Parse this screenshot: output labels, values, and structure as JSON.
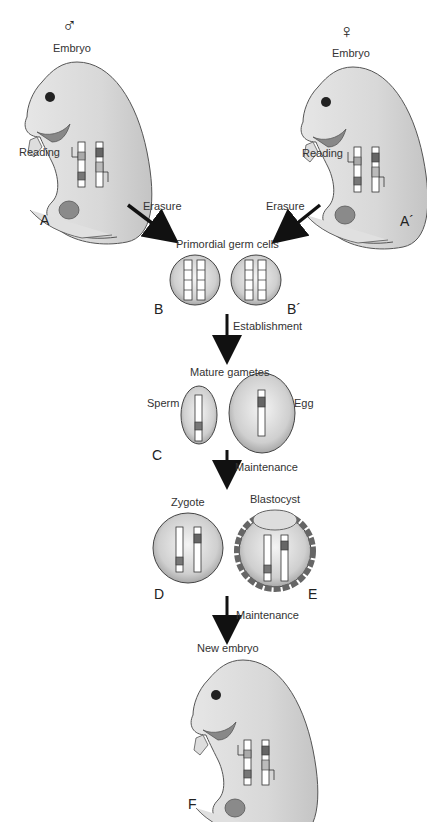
{
  "top": {
    "male_symbol": "♂",
    "female_symbol": "♀",
    "male_embryo_label": "Embryo",
    "female_embryo_label": "Embryo",
    "male_reading_label": "Reading",
    "female_reading_label": "Reading",
    "panel_a": "A",
    "panel_a_prime": "A´"
  },
  "steps": {
    "erasure_left": "Erasure",
    "erasure_right": "Erasure",
    "establishment": "Establishment",
    "maintenance_1": "Maintenance",
    "maintenance_2": "Maintenance"
  },
  "stages": {
    "pgc_title": "Primordial germ cells",
    "panel_b": "B",
    "panel_b_prime": "B´",
    "gametes_title": "Mature gametes",
    "sperm_label": "Sperm",
    "egg_label": "Egg",
    "panel_c": "C",
    "zygote_label": "Zygote",
    "blastocyst_label": "Blastocyst",
    "panel_d": "D",
    "panel_e": "E",
    "new_embryo_title": "New embryo",
    "panel_f": "F"
  }
}
